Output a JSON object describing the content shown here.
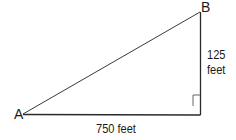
{
  "diagram": {
    "type": "right-triangle",
    "vertices": {
      "A": {
        "label": "A"
      },
      "B": {
        "label": "B"
      }
    },
    "sides": {
      "horizontal": {
        "label": "750 feet",
        "value": 750,
        "unit": "feet"
      },
      "vertical": {
        "label_value": "125",
        "label_unit": "feet",
        "value": 125,
        "unit": "feet"
      }
    },
    "right_angle_marker": true,
    "colors": {
      "line": "#2a2a2a",
      "text": "#1a1a1a"
    }
  }
}
